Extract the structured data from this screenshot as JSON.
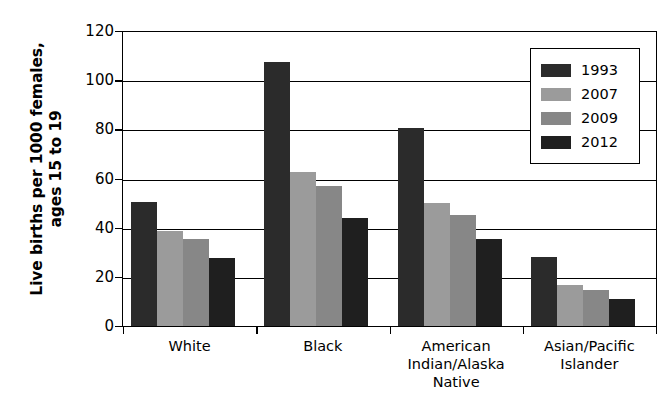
{
  "chart_data": {
    "type": "bar",
    "title": "",
    "xlabel": "",
    "ylabel": "Live births per 1000 females, ages 15 to 19",
    "ylim": [
      0,
      120
    ],
    "ytick_step": 20,
    "yticks": [
      120,
      100,
      80,
      60,
      40,
      20,
      0
    ],
    "grid": true,
    "legend_position": "top-right",
    "categories": [
      "White",
      "Black",
      "American\nIndian/Alaska\nNative",
      "Asian/Pacific\nIslander"
    ],
    "series": [
      {
        "name": "1993",
        "color": "#2b2b2b",
        "values": [
          50.5,
          107.5,
          80.5,
          28.0
        ]
      },
      {
        "name": "2007",
        "color": "#9b9b9b",
        "values": [
          38.5,
          62.5,
          50.0,
          16.5
        ]
      },
      {
        "name": "2009",
        "color": "#878787",
        "values": [
          35.5,
          57.0,
          45.0,
          14.5
        ]
      },
      {
        "name": "2012",
        "color": "#1f1f1f",
        "values": [
          27.5,
          44.0,
          35.5,
          11.0
        ]
      }
    ]
  },
  "axis": {
    "y_title_line1": "Live births per 1000 females,",
    "y_title_line2": "ages 15 to 19"
  },
  "category_labels": [
    {
      "lines": [
        "White"
      ]
    },
    {
      "lines": [
        "Black"
      ]
    },
    {
      "lines": [
        "American",
        "Indian/Alaska",
        "Native"
      ]
    },
    {
      "lines": [
        "Asian/Pacific",
        "Islander"
      ]
    }
  ],
  "legend": {
    "items": [
      {
        "label": "1993",
        "color": "#2b2b2b"
      },
      {
        "label": "2007",
        "color": "#9b9b9b"
      },
      {
        "label": "2009",
        "color": "#878787"
      },
      {
        "label": "2012",
        "color": "#1f1f1f"
      }
    ]
  }
}
